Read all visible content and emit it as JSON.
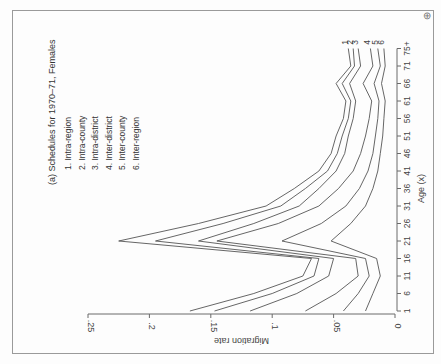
{
  "page": {
    "corner_icon": "⊕"
  },
  "chart_data": {
    "type": "line",
    "title": "(a) Schedules for 1970–71, Females",
    "xlabel": "Age (x)",
    "ylabel": "Migration rate",
    "orientation": "rotated 90° clockwise on page (age axis vertical at right, rate axis horizontal at bottom increasing leftward)",
    "x": [
      1,
      6,
      11,
      16,
      21,
      26,
      31,
      36,
      41,
      46,
      51,
      56,
      61,
      66,
      71,
      76
    ],
    "x_tick_labels": [
      "1",
      "6",
      "11",
      "16",
      "21",
      "26",
      "31",
      "36",
      "41",
      "46",
      "51",
      "56",
      "61",
      "66",
      "71",
      "75+"
    ],
    "y_tick_labels": [
      "0",
      ".05",
      ".1",
      ".15",
      ".2",
      ".25"
    ],
    "y_ticks": [
      0,
      0.05,
      0.1,
      0.15,
      0.2,
      0.25
    ],
    "ylim": [
      0,
      0.25
    ],
    "grid": false,
    "legend_position": "upper-left (page), inside plot",
    "series": [
      {
        "name": "1. Intra-region",
        "label": "1",
        "values": [
          0.167,
          0.115,
          0.075,
          0.068,
          0.225,
          0.16,
          0.105,
          0.082,
          0.062,
          0.052,
          0.048,
          0.042,
          0.04,
          0.048,
          0.036,
          0.038
        ]
      },
      {
        "name": "2. Intra-county",
        "label": "2",
        "values": [
          0.147,
          0.1,
          0.066,
          0.062,
          0.195,
          0.14,
          0.093,
          0.073,
          0.055,
          0.047,
          0.043,
          0.038,
          0.036,
          0.043,
          0.033,
          0.034
        ]
      },
      {
        "name": "3. Intra-district",
        "label": "3",
        "values": [
          0.118,
          0.08,
          0.054,
          0.05,
          0.16,
          0.115,
          0.078,
          0.062,
          0.048,
          0.041,
          0.038,
          0.034,
          0.032,
          0.037,
          0.028,
          0.03
        ]
      },
      {
        "name": "4. Inter-district",
        "label": "4",
        "values": [
          0.073,
          0.048,
          0.03,
          0.032,
          0.145,
          0.095,
          0.062,
          0.046,
          0.034,
          0.028,
          0.024,
          0.021,
          0.019,
          0.026,
          0.018,
          0.02
        ]
      },
      {
        "name": "5. Inter-county",
        "label": "5",
        "values": [
          0.042,
          0.03,
          0.021,
          0.024,
          0.092,
          0.06,
          0.04,
          0.029,
          0.022,
          0.018,
          0.016,
          0.014,
          0.013,
          0.017,
          0.012,
          0.014
        ]
      },
      {
        "name": "6. Inter-region",
        "label": "6",
        "values": [
          0.024,
          0.018,
          0.012,
          0.015,
          0.052,
          0.036,
          0.024,
          0.018,
          0.014,
          0.012,
          0.01,
          0.009,
          0.008,
          0.011,
          0.008,
          0.009
        ]
      }
    ]
  }
}
